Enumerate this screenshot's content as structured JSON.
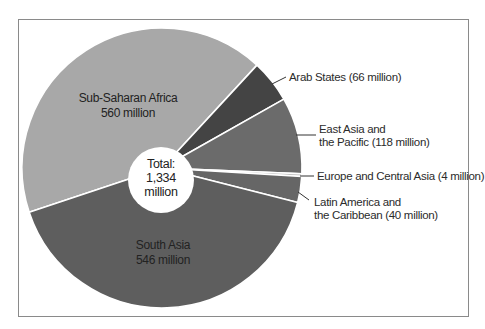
{
  "chart_data": {
    "type": "pie",
    "variant": "donut",
    "title": "",
    "unit": "million",
    "center_label": {
      "line1": "Total:",
      "line2": "1,334",
      "line3": "million"
    },
    "total": 1334,
    "series": [
      {
        "name": "Sub-Saharan Africa",
        "value": 560,
        "color": "#a8a8a8",
        "label_lines": [
          "Sub-Saharan Africa",
          "560 million"
        ],
        "label_position": "inside"
      },
      {
        "name": "Arab States",
        "value": 66,
        "color": "#444444",
        "label_lines": [
          "Arab States (66 million)"
        ],
        "label_position": "outside"
      },
      {
        "name": "East Asia and the Pacific",
        "value": 118,
        "color": "#6b6b6b",
        "label_lines": [
          "East Asia and",
          "the Pacific (118 million)"
        ],
        "label_position": "outside"
      },
      {
        "name": "Europe and Central Asia",
        "value": 4,
        "color": "#c4c4c4",
        "label_lines": [
          "Europe and Central Asia (4 million)"
        ],
        "label_position": "outside"
      },
      {
        "name": "Latin America and the Caribbean",
        "value": 40,
        "color": "#666666",
        "label_lines": [
          "Latin America and",
          "the Caribbean (40 million)"
        ],
        "label_position": "outside"
      },
      {
        "name": "South Asia",
        "value": 546,
        "color": "#5e5e5e",
        "label_lines": [
          "South Asia",
          "546 million"
        ],
        "label_position": "inside"
      }
    ],
    "legend": "none",
    "start_angle_deg_clockwise_from_top": 251.6
  },
  "labels": {
    "ssa_1": "Sub-Saharan Africa",
    "ssa_2": "560 million",
    "sa_1": "South Asia",
    "sa_2": "546 million",
    "arab": "Arab States (66 million)",
    "eap_1": "East Asia and",
    "eap_2": "the Pacific (118 million)",
    "eca": "Europe and Central Asia (4 million)",
    "lac_1": "Latin America and",
    "lac_2": "the Caribbean (40 million)",
    "total_1": "Total:",
    "total_2": "1,334",
    "total_3": "million"
  }
}
